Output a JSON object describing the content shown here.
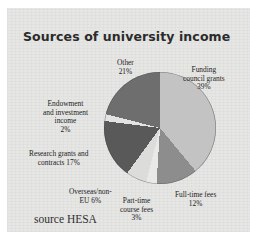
{
  "figure": {
    "title": "Sources of university income",
    "source": "source HESA",
    "panel_color": "#e6e6e4",
    "page_color": "#ffffff"
  },
  "chart_data": {
    "type": "pie",
    "title": "Sources of university income",
    "xlabel": "",
    "ylabel": "",
    "grid": false,
    "legend": "none",
    "labels_position": "outside-callout",
    "units": "percent",
    "total": 100,
    "start_angle_deg": 0,
    "direction": "clockwise",
    "categories": [
      "Funding council grants",
      "Full-time fees",
      "Part-time course fees",
      "Overseas/non-EU",
      "Research grants and contracts",
      "Endowment and investment income",
      "Other"
    ],
    "values": [
      39,
      12,
      3,
      6,
      17,
      2,
      21
    ],
    "slices": [
      {
        "name": "Funding council grants",
        "value": 39,
        "label_lines": "Funding\ncouncil grants\n39%",
        "color": "#c3c3c3",
        "label_left": 176,
        "label_top": 58
      },
      {
        "name": "Full-time fees",
        "value": 12,
        "label_lines": "Full-time fees\n12%",
        "color": "#8d8d8d",
        "label_left": 168,
        "label_top": 183
      },
      {
        "name": "Part-time course fees",
        "value": 3,
        "label_lines": "Part-time\ncourse fees\n3%",
        "color": "#e9e9e7",
        "label_left": 113,
        "label_top": 189
      },
      {
        "name": "Overseas/non-EU",
        "value": 6,
        "label_lines": "Overseas/non-\nEU 6%",
        "color": "#dcdcda",
        "label_left": 62,
        "label_top": 180
      },
      {
        "name": "Research grants and contracts",
        "value": 17,
        "label_lines": "Research grants and\ncontracts 17%",
        "color": "#595959",
        "label_left": 22,
        "label_top": 142
      },
      {
        "name": "Endowment and investment income",
        "value": 2,
        "label_lines": "Endowment\nand investment\nincome\n2%",
        "color": "#e3e3e1",
        "label_left": 36,
        "label_top": 92
      },
      {
        "name": "Other",
        "value": 21,
        "label_lines": "Other\n21%",
        "color": "#6e6e6e",
        "label_left": 110,
        "label_top": 51
      }
    ]
  }
}
